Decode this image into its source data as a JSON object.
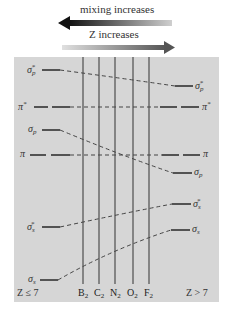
{
  "arrows": {
    "mixing": {
      "label": "mixing increases",
      "direction": "left"
    },
    "z": {
      "label": "Z increases",
      "direction": "right"
    }
  },
  "panel": {
    "background": "#d6d6d6",
    "left_caption": "Z ≤ 7",
    "right_caption": "Z > 7"
  },
  "molecules": [
    {
      "name": "B",
      "sub": "2",
      "x": 83
    },
    {
      "name": "C",
      "sub": "2",
      "x": 99
    },
    {
      "name": "N",
      "sub": "2",
      "x": 115
    },
    {
      "name": "O",
      "sub": "2",
      "x": 133
    },
    {
      "name": "F",
      "sub": "2",
      "x": 149
    }
  ],
  "levels": [
    {
      "id": "sigma_p_star",
      "base": "σ",
      "sub": "p",
      "sup": "*",
      "left_y": 70,
      "right_y": 86
    },
    {
      "id": "pi_star",
      "base": "π",
      "sub": "",
      "sup": "*",
      "left_y": 107,
      "right_y": 107,
      "degenerate": true
    },
    {
      "id": "sigma_p",
      "base": "σ",
      "sub": "p",
      "sup": "",
      "left_y": 130,
      "right_y": 173
    },
    {
      "id": "pi",
      "base": "π",
      "sub": "",
      "sup": "",
      "left_y": 155,
      "right_y": 155,
      "degenerate": true
    },
    {
      "id": "sigma_s_star",
      "base": "σ",
      "sub": "s",
      "sup": "*",
      "left_y": 227,
      "right_y": 204
    },
    {
      "id": "sigma_s",
      "base": "σ",
      "sub": "s",
      "sup": "",
      "left_y": 280,
      "right_y": 230
    }
  ],
  "labels": {
    "left": [
      {
        "base": "σ",
        "sub": "p",
        "sup": "*"
      },
      {
        "base": "π",
        "sub": "",
        "sup": "*"
      },
      {
        "base": "σ",
        "sub": "p",
        "sup": ""
      },
      {
        "base": "π",
        "sub": "",
        "sup": ""
      },
      {
        "base": "σ",
        "sub": "s",
        "sup": "*"
      },
      {
        "base": "σ",
        "sub": "s",
        "sup": ""
      }
    ],
    "right": [
      {
        "base": "σ",
        "sub": "p",
        "sup": "*"
      },
      {
        "base": "π",
        "sub": "",
        "sup": "*"
      },
      {
        "base": "π",
        "sub": "",
        "sup": ""
      },
      {
        "base": "σ",
        "sub": "p",
        "sup": ""
      },
      {
        "base": "σ",
        "sub": "s",
        "sup": "*"
      },
      {
        "base": "σ",
        "sub": "s",
        "sup": ""
      }
    ]
  }
}
